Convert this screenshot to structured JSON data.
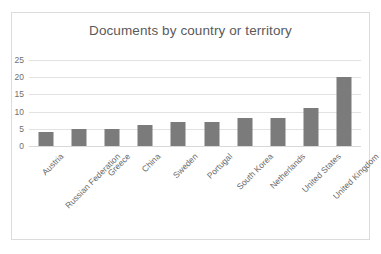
{
  "frame": {
    "border_color": "#dcdcdc",
    "background_color": "#ffffff"
  },
  "chart_data": {
    "type": "bar",
    "title": "Documents by country or territory",
    "xlabel": "",
    "ylabel": "",
    "categories": [
      "Austria",
      "Russian Federation",
      "Greece",
      "China",
      "Sweden",
      "Portugal",
      "South Korea",
      "Netherlands",
      "United States",
      "United Kingdom"
    ],
    "values": [
      4,
      5,
      5,
      6,
      7,
      7,
      8,
      8,
      11,
      20
    ],
    "ylim": [
      0,
      25
    ],
    "yticks": [
      0,
      5,
      10,
      15,
      20,
      25
    ],
    "ytick_labels": [
      "0",
      "5",
      "10",
      "15",
      "20",
      "25"
    ],
    "grid": true,
    "grid_axis": "y",
    "legend": false,
    "bar_color": "#7b7b7b",
    "gridline_color": "#e2e2e2",
    "title_color": "#5a5a5a",
    "tick_label_color": "#6a6a6a",
    "xtick_label_rotation": -45
  }
}
